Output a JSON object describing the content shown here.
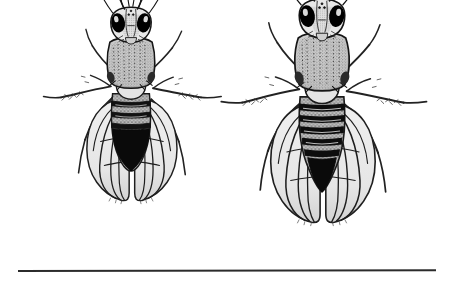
{
  "figure": {
    "kind": "scientific-illustration",
    "medium": "pen-and-ink engraving / stipple line drawing",
    "subject": "Drosophila melanogaster (fruit fly) sexual dimorphism",
    "background_color": "#ffffff",
    "ink_color": "#1a1a1a",
    "mid_tone_color": "#6e6e6e",
    "light_tone_color": "#d8d8d8",
    "wing_fill_color": "#ececec",
    "width_px": 453,
    "height_px": 282,
    "label": "Two fruit flies shown in dorsal view, male at left and female at right",
    "title": "",
    "caption": ""
  },
  "specimens": [
    {
      "id": "male",
      "position": "left",
      "label": "Male",
      "view": "dorsal",
      "relative_size": "smaller",
      "abdomen_pattern": "posterior segments fused into a solid black rounded tip",
      "abdomen_tip_shape": "rounded",
      "band_count": 3,
      "eye_color": "#000000",
      "center_x": 131,
      "center_y": 125
    },
    {
      "id": "female",
      "position": "right",
      "label": "Female",
      "view": "dorsal",
      "relative_size": "larger",
      "abdomen_pattern": "distinct alternating dark transverse bands along the whole abdomen",
      "abdomen_tip_shape": "pointed ovipositor",
      "band_count": 5,
      "eye_color": "#000000",
      "center_x": 322,
      "center_y": 133
    }
  ],
  "rule": {
    "name": "bottom-rule",
    "x_start_px": 18,
    "x_end_px": 436,
    "y_px": 271,
    "thickness_px": 2,
    "color": "#2b2b2b"
  }
}
